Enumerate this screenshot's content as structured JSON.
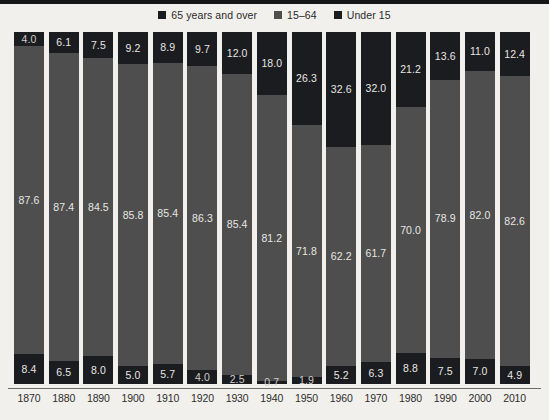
{
  "chart_data": {
    "type": "bar",
    "title": "",
    "subtitle": "",
    "xlabel": "",
    "ylabel": "",
    "ylim": [
      0,
      100
    ],
    "grid": false,
    "stacked": true,
    "normalized_percent": true,
    "legend_position": "top-center",
    "legend": [
      "65 years and over",
      "15–64",
      "Under 15"
    ],
    "categories": [
      "1870",
      "1880",
      "1890",
      "1900",
      "1910",
      "1920",
      "1930",
      "1940",
      "1950",
      "1960",
      "1970",
      "1980",
      "1990",
      "2000",
      "2010"
    ],
    "series": [
      {
        "name": "Under 15",
        "color": "#1b1c20",
        "position": "top",
        "values": [
          4.0,
          6.1,
          7.5,
          9.2,
          8.9,
          9.7,
          12.0,
          18.0,
          26.3,
          32.6,
          32.0,
          21.2,
          13.6,
          11.0,
          12.4
        ]
      },
      {
        "name": "15–64",
        "color": "#4e4e4e",
        "position": "middle",
        "values": [
          87.6,
          87.4,
          84.5,
          85.8,
          85.4,
          86.3,
          85.4,
          81.2,
          71.8,
          62.2,
          61.7,
          70.0,
          78.9,
          82.0,
          82.6
        ]
      },
      {
        "name": "65 years and over",
        "color": "#1b1c20",
        "position": "bottom",
        "values": [
          8.4,
          6.5,
          8.0,
          5.0,
          5.7,
          4.0,
          2.5,
          0.7,
          1.9,
          5.2,
          6.3,
          8.8,
          7.5,
          7.0,
          4.9
        ]
      }
    ],
    "value_labels": {
      "top": [
        "4.0",
        "6.1",
        "7.5",
        "9.2",
        "8.9",
        "9.7",
        "12.0",
        "18.0",
        "26.3",
        "32.6",
        "32.0",
        "21.2",
        "13.6",
        "11.0",
        "12.4"
      ],
      "middle": [
        "87.6",
        "87.4",
        "84.5",
        "85.8",
        "85.4",
        "86.3",
        "85.4",
        "81.2",
        "71.8",
        "62.2",
        "61.7",
        "70.0",
        "78.9",
        "82.0",
        "82.6"
      ],
      "bottom": [
        "8.4",
        "6.5",
        "8.0",
        "5.0",
        "5.7",
        "4.0",
        "2.5",
        "0.7",
        "1.9",
        "5.2",
        "6.3",
        "8.8",
        "7.5",
        "7.0",
        "4.9"
      ]
    }
  },
  "colors": {
    "background": "#f2f0ec",
    "dark_segment": "#1b1c20",
    "gray_segment": "#4e4e4e",
    "axis_line": "#6b6b6b",
    "label_text": "#2d2d2d",
    "value_text": "#e8e6e2"
  },
  "footnote": ""
}
